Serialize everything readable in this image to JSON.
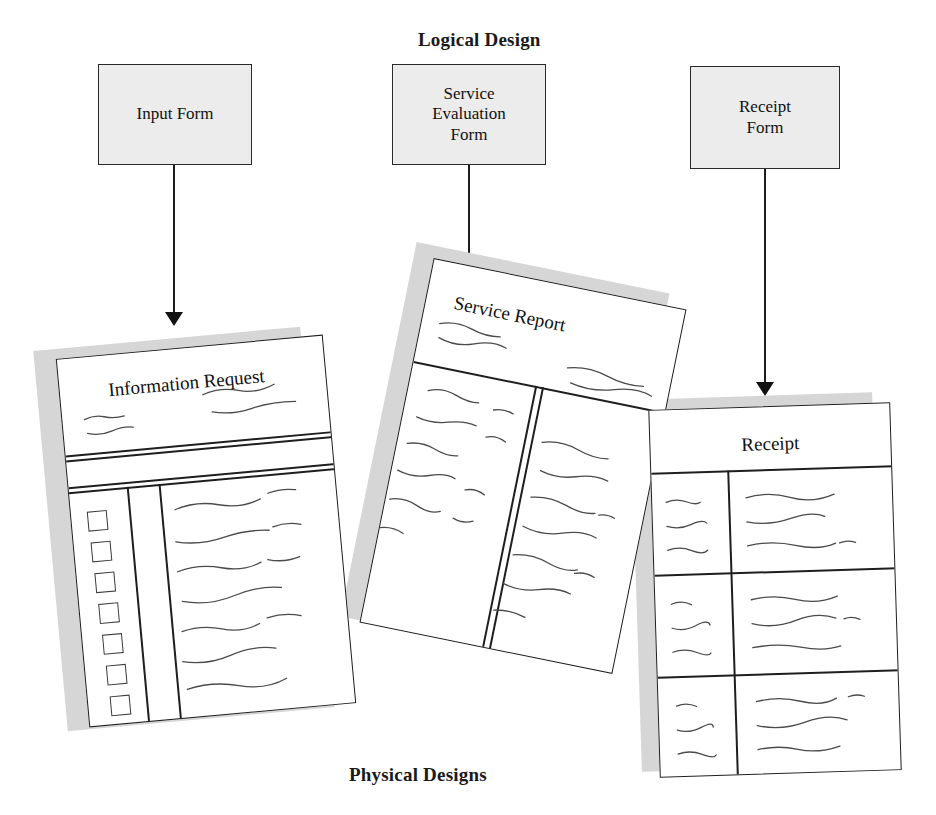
{
  "canvas": {
    "width": 936,
    "height": 815,
    "background": "#ffffff"
  },
  "labels": {
    "logical_design": "Logical Design",
    "physical_designs": "Physical Designs"
  },
  "colors": {
    "box_fill": "#ececec",
    "box_border": "#2a2a2a",
    "paper_fill": "#ffffff",
    "paper_border": "#1e1e1e",
    "paper_shadow": "#d6d6d6",
    "arrow": "#121212",
    "squiggle": "#4b4b4b",
    "text": "#141414"
  },
  "logical": {
    "boxes": [
      {
        "id": "input-form",
        "label": "Input Form"
      },
      {
        "id": "service-evaluation-form",
        "label": "Service\nEvaluation\nForm"
      },
      {
        "id": "receipt-form",
        "label": "Receipt\nForm"
      }
    ]
  },
  "arrows": [
    {
      "id": "arrow-input-to-information-request",
      "from": "input-form",
      "to": "information-request",
      "direction": "down"
    },
    {
      "id": "arrow-service-evaluation-to-service-report",
      "from": "service-evaluation-form",
      "to": "service-report",
      "direction": "down"
    },
    {
      "id": "arrow-receipt-form-to-receipt",
      "from": "receipt-form",
      "to": "receipt",
      "direction": "down"
    }
  ],
  "physical": {
    "documents": [
      {
        "id": "information-request",
        "title": "Information Request",
        "rotation_deg": -5.2,
        "has_shadow": true,
        "checkbox_count": 7,
        "layout": "header with two squiggle groups, rule pair, then checkbox column, narrow column, wide text column"
      },
      {
        "id": "service-report",
        "title": "Service Report",
        "rotation_deg": 11.5,
        "has_shadow": true,
        "checkbox_count": 0,
        "layout": "header with two squiggle groups, then two body columns of squiggle lines separated by a double rule"
      },
      {
        "id": "receipt",
        "title": "Receipt",
        "rotation_deg": -1.8,
        "has_shadow": true,
        "checkbox_count": 0,
        "layout": "title band then a two column by three row grid, each cell holding three squiggle lines"
      }
    ]
  }
}
